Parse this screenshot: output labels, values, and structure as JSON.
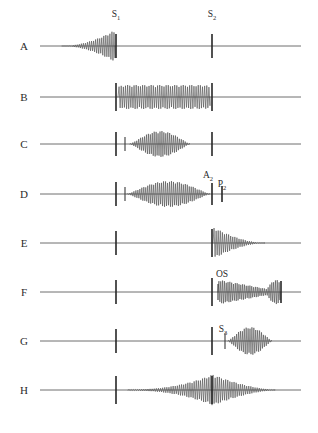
{
  "figure": {
    "width": 318,
    "height": 433,
    "background_color": "#ffffff",
    "baseline_color": "#6f6f6f",
    "murmur_color": "#4a4a4a",
    "sound_bar_color": "#262626",
    "label_color": "#2b2b2b"
  },
  "timeline": {
    "axis_start_x": 40,
    "axis_end_x": 301,
    "s1_x": 116,
    "s2_x": 212
  },
  "top_labels": [
    {
      "name": "s1",
      "base": "S",
      "sub": "1",
      "x": 116,
      "y": 17
    },
    {
      "name": "s2",
      "base": "S",
      "sub": "2",
      "x": 212,
      "y": 17
    }
  ],
  "traces": [
    {
      "id": "A",
      "label": "A",
      "label_x": 24,
      "baseline_y": 46,
      "description": "Presystolic crescendo murmur ending at S1",
      "murmur_shape": "crescendo",
      "murmur_start_x": 62,
      "murmur_end_x": 115,
      "murmur_peak_amp": 16,
      "murmur_cycles": 26,
      "sound_bars": [
        {
          "name": "s1-bar",
          "x": 116,
          "half_height": 12,
          "weight": "thick"
        },
        {
          "name": "s2-bar",
          "x": 212,
          "half_height": 12,
          "weight": "thick"
        }
      ],
      "inline_labels": []
    },
    {
      "id": "B",
      "label": "B",
      "label_x": 24,
      "baseline_y": 97,
      "description": "Holosystolic (pansystolic) plateau murmur from S1 to S2",
      "murmur_shape": "plateau",
      "murmur_start_x": 118,
      "murmur_end_x": 210,
      "murmur_peak_amp": 12,
      "murmur_cycles": 43,
      "sound_bars": [
        {
          "name": "s1-bar",
          "x": 116,
          "half_height": 14,
          "weight": "thick"
        },
        {
          "name": "s2-bar",
          "x": 212,
          "half_height": 14,
          "weight": "thick"
        }
      ],
      "inline_labels": []
    },
    {
      "id": "C",
      "label": "C",
      "label_x": 24,
      "baseline_y": 144,
      "description": "Early systolic ejection click with short diamond-shaped midsystolic murmur",
      "murmur_shape": "diamond",
      "murmur_start_x": 130,
      "murmur_end_x": 190,
      "murmur_peak_amp": 13,
      "murmur_cycles": 31,
      "sound_bars": [
        {
          "name": "s1-bar",
          "x": 116,
          "half_height": 12,
          "weight": "thick"
        },
        {
          "name": "ejection-click-bar",
          "x": 125,
          "half_height": 7,
          "weight": "thin"
        },
        {
          "name": "s2-bar",
          "x": 212,
          "half_height": 12,
          "weight": "thick"
        }
      ],
      "inline_labels": []
    },
    {
      "id": "D",
      "label": "D",
      "label_x": 24,
      "baseline_y": 194,
      "description": "Long diamond-shaped ejection murmur to A2 with widely split second sound (A2, P2)",
      "murmur_shape": "diamond",
      "murmur_start_x": 127,
      "murmur_end_x": 210,
      "murmur_peak_amp": 13,
      "murmur_cycles": 42,
      "sound_bars": [
        {
          "name": "s1-bar",
          "x": 116,
          "half_height": 12,
          "weight": "thick"
        },
        {
          "name": "ejection-click-bar",
          "x": 125,
          "half_height": 7,
          "weight": "thin"
        },
        {
          "name": "a2-bar",
          "x": 212,
          "half_height": 11,
          "weight": "thick"
        },
        {
          "name": "p2-bar",
          "x": 222,
          "half_height": 8,
          "weight": "thick"
        }
      ],
      "inline_labels": [
        {
          "name": "a2",
          "base": "A",
          "sub": "2",
          "x": 208,
          "y": 178
        },
        {
          "name": "p2",
          "base": "P",
          "sub": "2",
          "x": 222,
          "y": 187
        }
      ]
    },
    {
      "id": "E",
      "label": "E",
      "label_x": 24,
      "baseline_y": 243,
      "description": "Early diastolic decrescendo murmur beginning at S2",
      "murmur_shape": "decrescendo",
      "murmur_start_x": 213,
      "murmur_end_x": 265,
      "murmur_peak_amp": 16,
      "murmur_cycles": 25,
      "sound_bars": [
        {
          "name": "s1-bar",
          "x": 116,
          "half_height": 12,
          "weight": "thick"
        },
        {
          "name": "s2-bar",
          "x": 212,
          "half_height": 14,
          "weight": "thick"
        }
      ],
      "inline_labels": []
    },
    {
      "id": "F",
      "label": "F",
      "label_x": 24,
      "baseline_y": 292,
      "description": "Opening snap with mid-diastolic rumble and presystolic accentuation",
      "murmur_shape": "rumble-presystolic",
      "murmur_start_x": 218,
      "murmur_end_x": 280,
      "murmur_peak_amp": 13,
      "murmur_cycles": 34,
      "sound_bars": [
        {
          "name": "s1-bar",
          "x": 116,
          "half_height": 12,
          "weight": "thick"
        },
        {
          "name": "s2-bar",
          "x": 212,
          "half_height": 14,
          "weight": "thick"
        },
        {
          "name": "opening-snap-bar",
          "x": 218,
          "half_height": 8,
          "weight": "thin"
        },
        {
          "name": "next-s1-bar",
          "x": 281,
          "half_height": 11,
          "weight": "thick"
        }
      ],
      "inline_labels": [
        {
          "name": "os",
          "base": "OS",
          "sub": "",
          "x": 222,
          "y": 277
        }
      ]
    },
    {
      "id": "G",
      "label": "G",
      "label_x": 24,
      "baseline_y": 341,
      "description": "Third heart sound (S3) followed by a short mid-diastolic diamond rumble",
      "murmur_shape": "diamond",
      "murmur_start_x": 228,
      "murmur_end_x": 272,
      "murmur_peak_amp": 14,
      "murmur_cycles": 23,
      "sound_bars": [
        {
          "name": "s1-bar",
          "x": 116,
          "half_height": 12,
          "weight": "thick"
        },
        {
          "name": "s2-bar",
          "x": 212,
          "half_height": 14,
          "weight": "thick"
        },
        {
          "name": "s3-bar",
          "x": 225,
          "half_height": 8,
          "weight": "thin"
        }
      ],
      "inline_labels": [
        {
          "name": "s3",
          "base": "S",
          "sub": "3",
          "x": 223,
          "y": 332
        }
      ]
    },
    {
      "id": "H",
      "label": "H",
      "label_x": 24,
      "baseline_y": 390,
      "description": "Continuous murmur peaking around the second heart sound and spilling into diastole",
      "murmur_shape": "continuous",
      "murmur_start_x": 128,
      "murmur_end_x": 275,
      "murmur_peak_amp": 16,
      "murmur_cycles": 70,
      "sound_bars": [
        {
          "name": "s1-bar",
          "x": 116,
          "half_height": 14,
          "weight": "thick"
        },
        {
          "name": "s2-bar",
          "x": 212,
          "half_height": 14,
          "weight": "thick"
        }
      ],
      "inline_labels": []
    }
  ]
}
